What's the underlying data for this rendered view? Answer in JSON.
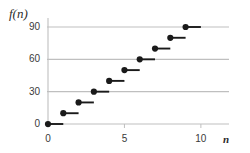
{
  "chart_data": {
    "type": "scatter",
    "title": "",
    "subtitle": "",
    "xlabel": "n",
    "ylabel": "f(n)",
    "x": [
      0,
      1,
      2,
      3,
      4,
      5,
      6,
      7,
      8,
      9
    ],
    "values": [
      0,
      10,
      20,
      30,
      40,
      50,
      60,
      70,
      80,
      90
    ],
    "series": [
      {
        "name": "f(n)",
        "values": [
          0,
          10,
          20,
          30,
          40,
          50,
          60,
          70,
          80,
          90
        ]
      }
    ],
    "points": [
      {
        "x": 0,
        "y": 0,
        "segment_to_x": 1,
        "marker": "filled-circle"
      },
      {
        "x": 1,
        "y": 10,
        "segment_to_x": 2,
        "marker": "filled-circle"
      },
      {
        "x": 2,
        "y": 20,
        "segment_to_x": 3,
        "marker": "filled-circle"
      },
      {
        "x": 3,
        "y": 30,
        "segment_to_x": 4,
        "marker": "filled-circle"
      },
      {
        "x": 4,
        "y": 40,
        "segment_to_x": 5,
        "marker": "filled-circle"
      },
      {
        "x": 5,
        "y": 50,
        "segment_to_x": 6,
        "marker": "filled-circle"
      },
      {
        "x": 6,
        "y": 60,
        "segment_to_x": 7,
        "marker": "filled-circle"
      },
      {
        "x": 7,
        "y": 70,
        "segment_to_x": 8,
        "marker": "filled-circle"
      },
      {
        "x": 8,
        "y": 80,
        "segment_to_x": 9,
        "marker": "filled-circle"
      },
      {
        "x": 9,
        "y": 90,
        "segment_to_x": 10,
        "marker": "filled-circle"
      }
    ],
    "xlim": [
      0,
      10.4
    ],
    "ylim": [
      0,
      97
    ],
    "xticks": [
      0,
      5,
      10
    ],
    "xtick_labels": [
      "0",
      "5",
      "10"
    ],
    "yticks": [
      0,
      30,
      60,
      90
    ],
    "ytick_labels": [
      "0",
      "30",
      "60",
      "90"
    ],
    "grid": {
      "horizontal": true,
      "vertical": false,
      "color": "#bfbfbf"
    },
    "legend": null,
    "colors": {
      "marker": "#1a1a1a",
      "segment": "#1a1a1a",
      "gridline": "#bfbfbf",
      "axis": "#bfbfbf",
      "text": "#3a3a3a"
    }
  },
  "axes": {
    "y_label_text": "f(n)",
    "x_label_text": "n"
  },
  "ticks": {
    "y": [
      {
        "label": "90"
      },
      {
        "label": "60"
      },
      {
        "label": "30"
      },
      {
        "label": "0"
      }
    ],
    "x": [
      {
        "label": "0"
      },
      {
        "label": "5"
      },
      {
        "label": "10"
      }
    ]
  }
}
